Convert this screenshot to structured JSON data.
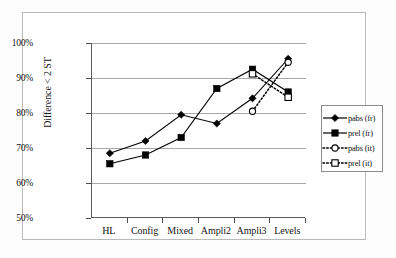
{
  "chart_data": {
    "type": "line",
    "title": "",
    "xlabel": "",
    "ylabel": "Difference < 2 ST",
    "categories": [
      "HL",
      "Config",
      "Mixed",
      "Ampli2",
      "Ampli3",
      "Levels"
    ],
    "ylim": [
      50,
      100
    ],
    "ytick_labels": [
      "100%",
      "90%",
      "80%",
      "70%",
      "60%",
      "50%"
    ],
    "ytick_values": [
      100,
      90,
      80,
      70,
      60,
      50
    ],
    "grid": true,
    "legend_position": "right",
    "series": [
      {
        "name": "pabs (fr)",
        "marker": "filled-diamond",
        "line": "solid",
        "color": "#000000",
        "values": [
          68.5,
          72.0,
          79.5,
          77.0,
          84.2,
          95.5
        ]
      },
      {
        "name": "prel (fr)",
        "marker": "filled-square",
        "line": "solid",
        "color": "#000000",
        "values": [
          65.5,
          68.0,
          73.0,
          87.0,
          92.5,
          86.0
        ]
      },
      {
        "name": "pabs (it)",
        "marker": "open-circle",
        "line": "dotted",
        "color": "#000000",
        "values": [
          null,
          null,
          null,
          null,
          80.5,
          94.5
        ]
      },
      {
        "name": "prel (it)",
        "marker": "open-square",
        "line": "dotted",
        "color": "#000000",
        "values": [
          null,
          null,
          null,
          null,
          91.2,
          84.5
        ]
      }
    ]
  },
  "legend": {
    "entries": [
      {
        "label": "pabs (fr)"
      },
      {
        "label": "prel (fr)"
      },
      {
        "label": "pabs (it)"
      },
      {
        "label": "prel (it)"
      }
    ]
  }
}
